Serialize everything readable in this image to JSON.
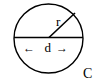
{
  "diagram": {
    "labels": {
      "radius": "r",
      "diameter": "d",
      "circumference": "C",
      "left_arrow": "←",
      "right_arrow": "→"
    },
    "colors": {
      "stroke": "#000000",
      "background": "#ffffff"
    }
  }
}
